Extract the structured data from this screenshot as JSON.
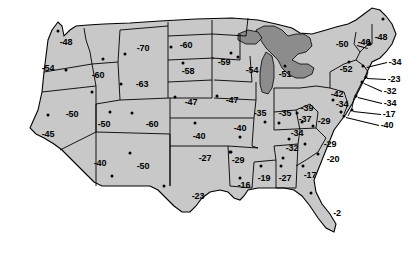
{
  "chart_data": {
    "type": "map",
    "title": "",
    "subtitle": "",
    "value_prefix": "-",
    "units": "",
    "legend": [],
    "colors": {
      "land_fill": "#c8c8c8",
      "land_stroke": "#000000",
      "water_fill": "#8c8c8c",
      "background": "#ffffff",
      "label_text": "#000000",
      "marker": "#000000"
    },
    "categories": [
      "WA",
      "OR",
      "CA",
      "NV",
      "ID",
      "MT",
      "WY",
      "UT",
      "CO",
      "AZ",
      "NM",
      "ND",
      "SD",
      "NE",
      "KS",
      "OK",
      "TX",
      "MN",
      "IA",
      "MO",
      "AR",
      "LA",
      "WI",
      "IL",
      "MI",
      "IN",
      "OH",
      "KY",
      "TN",
      "MS",
      "AL",
      "GA",
      "FL",
      "SC",
      "NC",
      "VA",
      "WV",
      "PA",
      "NY",
      "VT",
      "NH",
      "ME",
      "MA",
      "RI",
      "CT",
      "NJ",
      "DE",
      "MD",
      "DC"
    ],
    "values": [
      -48,
      -54,
      -45,
      -50,
      -60,
      -70,
      -63,
      -50,
      -60,
      -40,
      -50,
      -60,
      -58,
      -47,
      -40,
      -27,
      -23,
      -59,
      -47,
      -40,
      -29,
      -16,
      -54,
      -35,
      -51,
      -35,
      -39,
      -34,
      -32,
      -19,
      -27,
      -17,
      -2,
      -20,
      -29,
      -29,
      -37,
      -42,
      -52,
      -46,
      -48,
      -34,
      -23,
      -32,
      -34,
      -17,
      -40,
      -50,
      -34
    ],
    "labels": [
      {
        "state": "WA",
        "text": "-48",
        "x": 66,
        "y": 42,
        "marker": {
          "x": 58,
          "y": 31
        }
      },
      {
        "state": "OR",
        "text": "-54",
        "x": 48,
        "y": 68,
        "marker": {
          "x": 66,
          "y": 70
        }
      },
      {
        "state": "CA",
        "text": "-45",
        "x": 48,
        "y": 134,
        "marker": {
          "x": 48,
          "y": 115
        }
      },
      {
        "state": "NV",
        "text": "-50",
        "x": 72,
        "y": 114,
        "marker": {
          "x": 92,
          "y": 92
        }
      },
      {
        "state": "ID",
        "text": "-60",
        "x": 98,
        "y": 75,
        "marker": {
          "x": 103,
          "y": 59
        }
      },
      {
        "state": "MT",
        "text": "-70",
        "x": 143,
        "y": 48,
        "marker": {
          "x": 125,
          "y": 54
        }
      },
      {
        "state": "WY",
        "text": "-63",
        "x": 142,
        "y": 84,
        "marker": {
          "x": 121,
          "y": 84
        }
      },
      {
        "state": "UT",
        "text": "-50",
        "x": 104,
        "y": 124,
        "marker": {
          "x": 110,
          "y": 112
        }
      },
      {
        "state": "CO",
        "text": "-60",
        "x": 152,
        "y": 124,
        "marker": {
          "x": 132,
          "y": 113
        }
      },
      {
        "state": "AZ",
        "text": "-40",
        "x": 100,
        "y": 163,
        "marker": {
          "x": 112,
          "y": 176
        }
      },
      {
        "state": "NM",
        "text": "-50",
        "x": 143,
        "y": 166,
        "marker": {
          "x": 130,
          "y": 153
        }
      },
      {
        "state": "ND",
        "text": "-60",
        "x": 186,
        "y": 45,
        "marker": {
          "x": 171,
          "y": 47
        }
      },
      {
        "state": "SD",
        "text": "-58",
        "x": 188,
        "y": 71,
        "marker": {
          "x": 183,
          "y": 63
        }
      },
      {
        "state": "NE",
        "text": "-47",
        "x": 191,
        "y": 102,
        "marker": {
          "x": 175,
          "y": 97
        }
      },
      {
        "state": "KS",
        "text": "-40",
        "x": 199,
        "y": 136,
        "marker": {
          "x": 195,
          "y": 123
        }
      },
      {
        "state": "OK",
        "text": "-27",
        "x": 205,
        "y": 158,
        "marker": {
          "x": 230,
          "y": 152
        }
      },
      {
        "state": "TX",
        "text": "-23",
        "x": 198,
        "y": 196,
        "marker": {
          "x": 164,
          "y": 186
        }
      },
      {
        "state": "MN",
        "text": "-59",
        "x": 224,
        "y": 62,
        "marker": {
          "x": 231,
          "y": 53
        }
      },
      {
        "state": "IA",
        "text": "-47",
        "x": 232,
        "y": 100,
        "marker": {
          "x": 217,
          "y": 96
        }
      },
      {
        "state": "MO",
        "text": "-40",
        "x": 240,
        "y": 128,
        "marker": {
          "x": 240,
          "y": 137
        }
      },
      {
        "state": "AR",
        "text": "-29",
        "x": 238,
        "y": 160,
        "marker": {
          "x": 231,
          "y": 152
        }
      },
      {
        "state": "LA",
        "text": "-16",
        "x": 244,
        "y": 185,
        "marker": {
          "x": 240,
          "y": 178
        }
      },
      {
        "state": "WI",
        "text": "-54",
        "x": 252,
        "y": 70,
        "marker": {
          "x": 238,
          "y": 57
        }
      },
      {
        "state": "IL",
        "text": "-35",
        "x": 260,
        "y": 113,
        "marker": {
          "x": 265,
          "y": 122
        }
      },
      {
        "state": "MI",
        "text": "-51",
        "x": 285,
        "y": 74,
        "marker": {
          "x": 285,
          "y": 66
        }
      },
      {
        "state": "IN",
        "text": "-35",
        "x": 285,
        "y": 113,
        "marker": {
          "x": 279,
          "y": 123
        }
      },
      {
        "state": "OH",
        "text": "-39",
        "x": 307,
        "y": 108,
        "marker": {
          "x": 302,
          "y": 122
        }
      },
      {
        "state": "KY",
        "text": "-34",
        "x": 297,
        "y": 133,
        "marker": {
          "x": 289,
          "y": 139
        }
      },
      {
        "state": "TN",
        "text": "-32",
        "x": 292,
        "y": 148,
        "marker": {
          "x": 283,
          "y": 158
        }
      },
      {
        "state": "MS",
        "text": "-19",
        "x": 264,
        "y": 178,
        "marker": {
          "x": 261,
          "y": 166
        }
      },
      {
        "state": "AL",
        "text": "-27",
        "x": 285,
        "y": 178,
        "marker": {
          "x": 281,
          "y": 166
        }
      },
      {
        "state": "GA",
        "text": "-17",
        "x": 310,
        "y": 175,
        "marker": {
          "x": 303,
          "y": 166
        }
      },
      {
        "state": "FL",
        "text": "-2",
        "x": 337,
        "y": 213,
        "marker": {
          "x": 311,
          "y": 193
        }
      },
      {
        "state": "SC",
        "text": "-20",
        "x": 333,
        "y": 159,
        "marker": {
          "x": 318,
          "y": 154
        }
      },
      {
        "state": "NC",
        "text": "-29",
        "x": 330,
        "y": 144,
        "marker": {
          "x": 305,
          "y": 144
        }
      },
      {
        "state": "VA",
        "text": "-29",
        "x": 324,
        "y": 121,
        "marker": {
          "x": 313,
          "y": 126
        }
      },
      {
        "state": "WV",
        "text": "-37",
        "x": 305,
        "y": 119,
        "marker": {
          "x": 297,
          "y": 113
        }
      },
      {
        "state": "PA",
        "text": "-42",
        "x": 337,
        "y": 94,
        "marker": {
          "x": 333,
          "y": 100
        }
      },
      {
        "state": "NY",
        "text": "-52",
        "x": 346,
        "y": 69,
        "marker": {
          "x": 349,
          "y": 62
        }
      },
      {
        "state": "VT",
        "text": "-46",
        "x": 364,
        "y": 42,
        "marker": {
          "x": 370,
          "y": 44
        }
      },
      {
        "state": "NH",
        "text": "-50",
        "x": 342,
        "y": 44,
        "marker": {
          "x": 369,
          "y": 44
        }
      },
      {
        "state": "ME",
        "text": "-48",
        "x": 381,
        "y": 37,
        "marker": {
          "x": 383,
          "y": 19
        }
      },
      {
        "state": "MA",
        "text": "-34",
        "x": 395,
        "y": 62,
        "marker": {
          "x": 363,
          "y": 66
        }
      },
      {
        "state": "RI",
        "text": "-23",
        "x": 394,
        "y": 79,
        "marker": {
          "x": 366,
          "y": 77
        }
      },
      {
        "state": "CT",
        "text": "-32",
        "x": 390,
        "y": 91,
        "marker": {
          "x": 362,
          "y": 82
        }
      },
      {
        "state": "NJ",
        "text": "-34",
        "x": 390,
        "y": 103,
        "marker": {
          "x": 356,
          "y": 96
        }
      },
      {
        "state": "DE",
        "text": "-17",
        "x": 389,
        "y": 114,
        "marker": {
          "x": 352,
          "y": 110
        }
      },
      {
        "state": "MD",
        "text": "-40",
        "x": 387,
        "y": 125,
        "marker": {
          "x": 344,
          "y": 116
        }
      },
      {
        "state": "DC",
        "text": "-34",
        "x": 342,
        "y": 104,
        "marker": {
          "x": 341,
          "y": 112
        }
      }
    ],
    "leader_lines": [
      {
        "from": {
          "x": 357,
          "y": 45
        },
        "to": {
          "x": 368,
          "y": 48
        }
      },
      {
        "from": {
          "x": 369,
          "y": 39
        },
        "to": {
          "x": 371,
          "y": 45
        }
      },
      {
        "from": {
          "x": 387,
          "y": 62
        },
        "to": {
          "x": 367,
          "y": 67
        }
      },
      {
        "from": {
          "x": 386,
          "y": 79
        },
        "to": {
          "x": 367,
          "y": 78
        }
      },
      {
        "from": {
          "x": 382,
          "y": 91
        },
        "to": {
          "x": 364,
          "y": 83
        }
      },
      {
        "from": {
          "x": 382,
          "y": 103
        },
        "to": {
          "x": 358,
          "y": 97
        }
      },
      {
        "from": {
          "x": 381,
          "y": 114
        },
        "to": {
          "x": 353,
          "y": 111
        }
      },
      {
        "from": {
          "x": 379,
          "y": 125
        },
        "to": {
          "x": 346,
          "y": 117
        }
      }
    ],
    "xlabel": "",
    "ylabel": "",
    "grid": false,
    "legend_position": "none"
  }
}
